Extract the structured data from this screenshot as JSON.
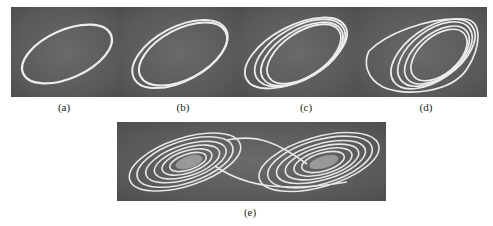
{
  "figure": {
    "panels": [
      {
        "id": "a",
        "label": "(a)",
        "description": "single-period limit cycle"
      },
      {
        "id": "b",
        "label": "(b)",
        "description": "period-2 limit cycle"
      },
      {
        "id": "c",
        "label": "(c)",
        "description": "period-4 limit cycle"
      },
      {
        "id": "d",
        "label": "(d)",
        "description": "chaotic single-scroll attractor"
      },
      {
        "id": "e",
        "label": "(e)",
        "description": "double-scroll attractor"
      }
    ],
    "colors": {
      "background": "#5e5e5e",
      "trace": "#f2f2f2",
      "page": "#ffffff"
    }
  }
}
